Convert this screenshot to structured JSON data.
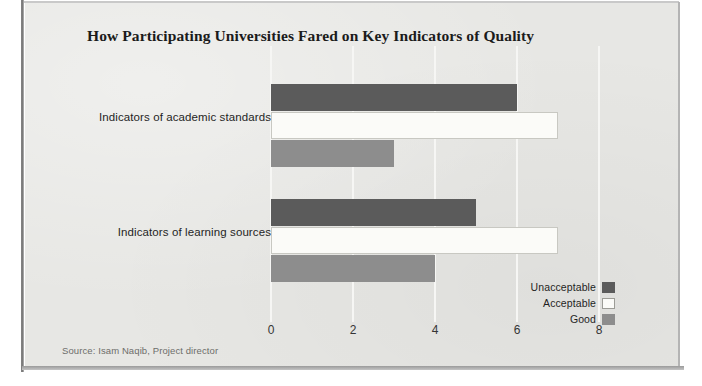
{
  "chart_data": {
    "type": "bar",
    "orientation": "horizontal",
    "title": "How Participating Universities Fared on Key Indicators of Quality",
    "xlabel": "",
    "ylabel": "",
    "xlim": [
      0,
      8
    ],
    "xticks": [
      0,
      2,
      4,
      6,
      8
    ],
    "xtick_labels": [
      "0",
      "2",
      "4",
      "6",
      "8"
    ],
    "grid": true,
    "grid_axis": "x",
    "legend_position": "bottom-right",
    "categories": [
      "Indicators of academic standards",
      "Indicators of learning sources"
    ],
    "series": [
      {
        "name": "Unacceptable",
        "color": "#5b5b5b",
        "values": [
          6,
          5
        ]
      },
      {
        "name": "Acceptable",
        "color": "#fbfbf8",
        "values": [
          7,
          7
        ]
      },
      {
        "name": "Good",
        "color": "#8d8d8d",
        "values": [
          3,
          4
        ]
      }
    ],
    "source": "Source: Isam Naqib, Project director"
  },
  "colors": {
    "background": "#e7e7e4",
    "gridline": "#f6f6f4",
    "unacceptable": "#5b5b5b",
    "acceptable": "#fbfbf8",
    "good": "#8d8d8d",
    "title_text": "#1b1b1b",
    "source_text": "#6d6d6a"
  }
}
